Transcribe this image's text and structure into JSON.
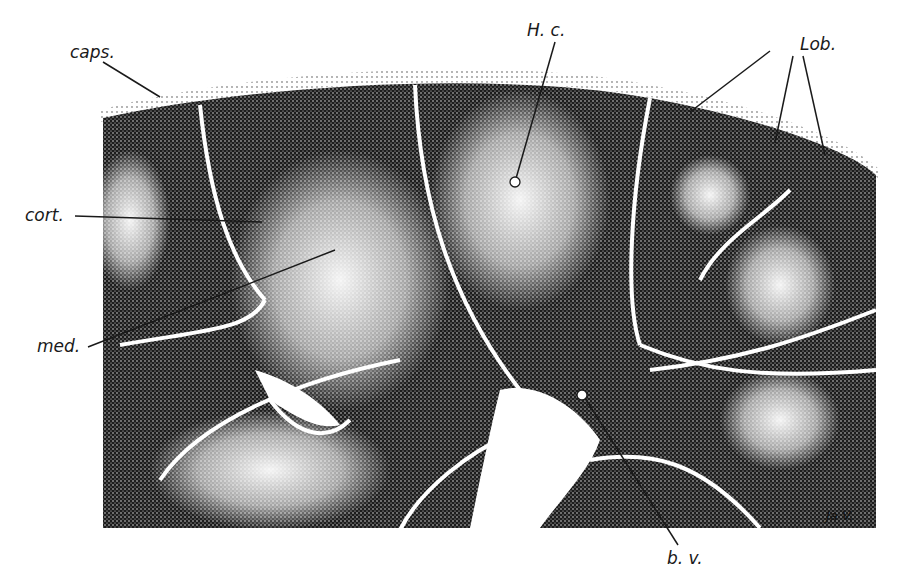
{
  "figure": {
    "colors": {
      "tissue_dark": "#141414",
      "tissue_light": "#f2f2f2",
      "background": "#ffffff",
      "label_line": "#1a1a1a"
    }
  },
  "labels": {
    "caps": "caps.",
    "hc": "H. c.",
    "lob": "Lob.",
    "cort": "cort.",
    "med": "med.",
    "bv": "b. v."
  },
  "signature": "Ja V."
}
